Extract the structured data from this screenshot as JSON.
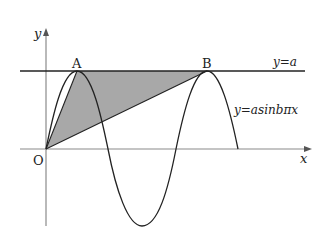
{
  "figure": {
    "type": "function-graph",
    "axes": {
      "x_label": "x",
      "y_label": "y",
      "origin_label": "O",
      "axis_color": "#8a8a8a"
    },
    "curves": [
      {
        "name": "sine-curve",
        "label": "y=asinbπx",
        "color": "#222222"
      },
      {
        "name": "horizontal-line",
        "label": "y=a",
        "color": "#222222"
      }
    ],
    "points": [
      {
        "name": "point-a",
        "label": "A"
      },
      {
        "name": "point-b",
        "label": "B"
      },
      {
        "name": "origin",
        "label": "O"
      }
    ],
    "shaded_region": {
      "description": "triangle OAB",
      "fill": "#a8a8a8"
    }
  }
}
